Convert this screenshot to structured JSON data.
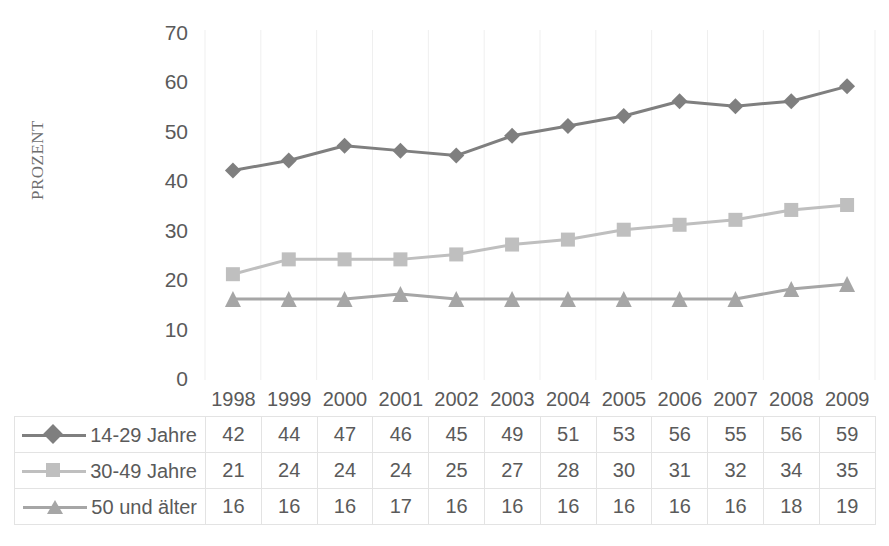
{
  "chart_data": {
    "type": "line",
    "title": "",
    "xlabel": "",
    "ylabel": "PROZENT",
    "ylim": [
      0,
      70
    ],
    "ytick_step": 10,
    "yticks": [
      70,
      60,
      50,
      40,
      30,
      20,
      10,
      0
    ],
    "grid": "vertical",
    "legend_position": "data-table-left",
    "categories": [
      "1998",
      "1999",
      "2000",
      "2001",
      "2002",
      "2003",
      "2004",
      "2005",
      "2006",
      "2007",
      "2008",
      "2009"
    ],
    "series": [
      {
        "name": "14-29 Jahre",
        "marker": "diamond",
        "color": "#7f7f7f",
        "values": [
          42,
          44,
          47,
          46,
          45,
          49,
          51,
          53,
          56,
          55,
          56,
          59
        ]
      },
      {
        "name": "30-49 Jahre",
        "marker": "square",
        "color": "#bfbfbf",
        "values": [
          21,
          24,
          24,
          24,
          25,
          27,
          28,
          30,
          31,
          32,
          34,
          35
        ]
      },
      {
        "name": "50 und älter",
        "marker": "triangle",
        "color": "#a6a6a6",
        "values": [
          16,
          16,
          16,
          17,
          16,
          16,
          16,
          16,
          16,
          16,
          18,
          19
        ]
      }
    ]
  },
  "axis": {
    "y_title": "PROZENT",
    "y_tick_labels": [
      "70",
      "60",
      "50",
      "40",
      "30",
      "20",
      "10",
      "0"
    ]
  },
  "table": {
    "corner_label": "",
    "year_headers": [
      "1998",
      "1999",
      "2000",
      "2001",
      "2002",
      "2003",
      "2004",
      "2005",
      "2006",
      "2007",
      "2008",
      "2009"
    ],
    "rows": [
      {
        "label": "14-29 Jahre",
        "marker": "diamond",
        "color": "#7f7f7f",
        "cells": [
          "42",
          "44",
          "47",
          "46",
          "45",
          "49",
          "51",
          "53",
          "56",
          "55",
          "56",
          "59"
        ]
      },
      {
        "label": "30-49 Jahre",
        "marker": "square",
        "color": "#bfbfbf",
        "cells": [
          "21",
          "24",
          "24",
          "24",
          "25",
          "27",
          "28",
          "30",
          "31",
          "32",
          "34",
          "35"
        ]
      },
      {
        "label": "50 und älter",
        "marker": "triangle",
        "color": "#a6a6a6",
        "cells": [
          "16",
          "16",
          "16",
          "17",
          "16",
          "16",
          "16",
          "16",
          "16",
          "16",
          "18",
          "19"
        ]
      }
    ]
  },
  "colors": {
    "gridline": "#efefef",
    "table_border": "#e3e3e3",
    "text": "#5a5a5a",
    "background": "#ffffff"
  }
}
